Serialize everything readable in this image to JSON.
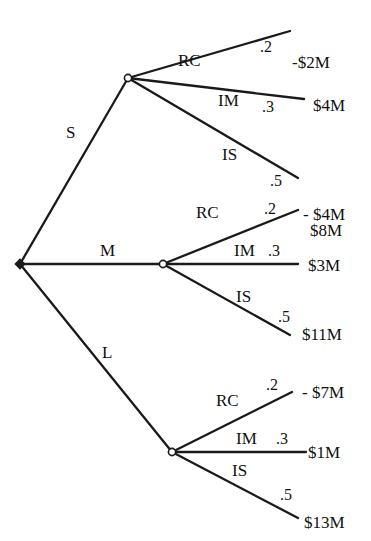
{
  "diagram": {
    "type": "decision-tree",
    "root": {
      "kind": "decision",
      "x": 20,
      "y": 264
    },
    "decisions": [
      {
        "label": "S",
        "label_pos": [
          66,
          138
        ],
        "node": {
          "kind": "chance",
          "x": 128,
          "y": 78
        },
        "outcomes": [
          {
            "label": "RC",
            "label_pos": [
              178,
              66
            ],
            "prob": ".2",
            "prob_pos": [
              260,
              52
            ],
            "payoff": "-$2M",
            "payoff_pos": [
              292,
              68
            ],
            "end": [
              290,
              31
            ]
          },
          {
            "label": "IM",
            "label_pos": [
              218,
              106
            ],
            "prob": ".3",
            "prob_pos": [
              262,
              112
            ],
            "payoff": "$4M",
            "payoff_pos": [
              313,
              111
            ],
            "end": [
              304,
              99
            ]
          },
          {
            "label": "IS",
            "label_pos": [
              222,
              160
            ],
            "prob": ".5",
            "prob_pos": [
              270,
              186
            ],
            "payoff": "$8M",
            "payoff_pos": [
              310,
              236
            ],
            "end": [
              298,
              178
            ]
          }
        ]
      },
      {
        "label": "M",
        "label_pos": [
          100,
          256
        ],
        "node": {
          "kind": "chance",
          "x": 163,
          "y": 264
        },
        "outcomes": [
          {
            "label": "RC",
            "label_pos": [
              196,
              218
            ],
            "prob": ".2",
            "prob_pos": [
              264,
              214
            ],
            "payoff": "- $4M",
            "payoff_pos": [
              303,
              220
            ],
            "end": [
              298,
              210
            ]
          },
          {
            "label": "IM",
            "label_pos": [
              234,
              256
            ],
            "prob": ".3",
            "prob_pos": [
              268,
              256
            ],
            "payoff": "$3M",
            "payoff_pos": [
              308,
              271
            ],
            "end": [
              298,
              264
            ]
          },
          {
            "label": "IS",
            "label_pos": [
              236,
              302
            ],
            "prob": ".5",
            "prob_pos": [
              278,
              322
            ],
            "payoff": "$11M",
            "payoff_pos": [
              302,
              340
            ],
            "end": [
              290,
              335
            ]
          }
        ]
      },
      {
        "label": "L",
        "label_pos": [
          102,
          358
        ],
        "node": {
          "kind": "chance",
          "x": 172,
          "y": 452
        },
        "outcomes": [
          {
            "label": "RC",
            "label_pos": [
              216,
              406
            ],
            "prob": ".2",
            "prob_pos": [
              266,
              390
            ],
            "payoff": "- $7M",
            "payoff_pos": [
              302,
              398
            ],
            "end": [
              292,
              392
            ]
          },
          {
            "label": "IM",
            "label_pos": [
              236,
              444
            ],
            "prob": ".3",
            "prob_pos": [
              276,
              444
            ],
            "payoff": "$1M",
            "payoff_pos": [
              308,
              458
            ],
            "end": [
              306,
              452
            ]
          },
          {
            "label": "IS",
            "label_pos": [
              232,
              476
            ],
            "prob": ".5",
            "prob_pos": [
              280,
              500
            ],
            "payoff": "$13M",
            "payoff_pos": [
              304,
              528
            ],
            "end": [
              298,
              518
            ]
          }
        ]
      }
    ],
    "colors": {
      "line": "#1a1a1a",
      "text": "#111111",
      "background": "#ffffff"
    }
  }
}
